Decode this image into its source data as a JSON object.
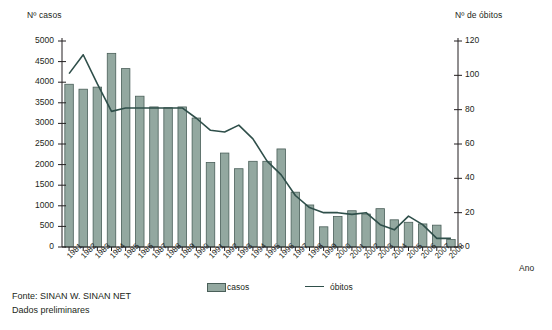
{
  "axes": {
    "left_title": "Nº casos",
    "right_title": "Nº de óbitos",
    "x_title": "Ano"
  },
  "legend": {
    "casos": "casos",
    "obitos": "óbitos"
  },
  "footer": {
    "line1": "Fonte: SINAN W. SINAN NET",
    "line2": "Dados preliminares"
  },
  "colors": {
    "bar_fill": "#93a8a0",
    "bar_stroke": "#4a5f59",
    "line": "#2f4f4a",
    "axis": "#231f20"
  },
  "chart_data": {
    "type": "bar",
    "title": "",
    "xlabel": "Ano",
    "ylabel": "Nº casos",
    "y2label": "Nº de óbitos",
    "ylim": [
      0,
      5000
    ],
    "y2lim": [
      0,
      120
    ],
    "yticks": [
      0,
      500,
      1000,
      1500,
      2000,
      2500,
      3000,
      3500,
      4000,
      4500,
      5000
    ],
    "y2ticks": [
      0,
      20,
      40,
      60,
      80,
      100,
      120
    ],
    "grid": false,
    "legend_position": "bottom",
    "categories": [
      "1981",
      "1982",
      "1983",
      "1984",
      "1985",
      "1986",
      "1987",
      "1988",
      "1989",
      "1990",
      "1991",
      "1992",
      "1993",
      "1994",
      "1995",
      "1996",
      "1997",
      "1998",
      "1999",
      "2000",
      "2001",
      "2002",
      "2003",
      "2004",
      "2005",
      "2006",
      "2007",
      "2008"
    ],
    "series": [
      {
        "name": "casos",
        "type": "bar",
        "axis": "left",
        "values": [
          3950,
          3830,
          3880,
          4700,
          4330,
          3660,
          3400,
          3380,
          3400,
          3130,
          2050,
          2280,
          1900,
          2080,
          2080,
          2380,
          1330,
          1020,
          490,
          740,
          880,
          800,
          930,
          660,
          600,
          560,
          530,
          180
        ]
      },
      {
        "name": "óbitos",
        "type": "line",
        "axis": "right",
        "values": [
          101,
          112,
          95,
          79,
          81,
          81,
          81,
          81,
          81,
          75,
          68,
          67,
          71,
          63,
          50,
          42,
          30,
          23,
          20,
          20,
          19,
          20,
          13,
          10,
          18,
          13,
          5,
          5
        ]
      }
    ]
  }
}
